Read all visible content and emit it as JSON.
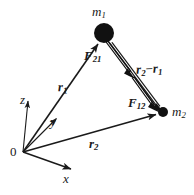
{
  "figure": {
    "background_color": "#ffffff",
    "ink_color": "#1a1a1a"
  },
  "masses": [
    {
      "id": "m1",
      "label": "m",
      "subscript": "1",
      "x": 104,
      "y": 33,
      "radius": 10,
      "fill": "#111111"
    },
    {
      "id": "m2",
      "label": "m",
      "subscript": "2",
      "x": 163,
      "y": 112,
      "radius": 5,
      "fill": "#111111"
    }
  ],
  "origin": {
    "label": "0",
    "x": 23,
    "y": 152
  },
  "axes": [
    {
      "id": "z",
      "label": "z",
      "from": [
        23,
        152
      ],
      "to": [
        28,
        99
      ]
    },
    {
      "id": "y",
      "label": "y",
      "from": [
        23,
        152
      ],
      "to": [
        58,
        117
      ]
    },
    {
      "id": "x",
      "label": "x",
      "from": [
        23,
        152
      ],
      "to": [
        73,
        170
      ]
    }
  ],
  "position_vectors": [
    {
      "id": "r1",
      "label": "r",
      "subscript": "1",
      "from": [
        23,
        152
      ],
      "to": [
        99,
        42
      ],
      "description": "position vector from origin to m1"
    },
    {
      "id": "r2",
      "label": "r",
      "subscript": "2",
      "from": [
        23,
        152
      ],
      "to": [
        158,
        114
      ],
      "description": "position vector from origin to m2"
    }
  ],
  "separation_vector": {
    "id": "r2-r1",
    "label_first": "r",
    "sub_first": "2",
    "operator": "−",
    "label_second": "r",
    "sub_second": "1",
    "from": [
      110,
      42
    ],
    "to": [
      160,
      108
    ],
    "description": "separation vector r2 minus r1"
  },
  "force_vectors": [
    {
      "id": "F21",
      "label": "F",
      "subscript": "21",
      "from": [
        107,
        40
      ],
      "to": [
        133,
        76
      ],
      "description": "force on m1 due to m2, directed toward m2"
    },
    {
      "id": "F12",
      "label": "F",
      "subscript": "12",
      "from": [
        133,
        76
      ],
      "to": [
        157,
        109
      ],
      "description": "force on m2 due to m1, directed toward m2"
    }
  ]
}
